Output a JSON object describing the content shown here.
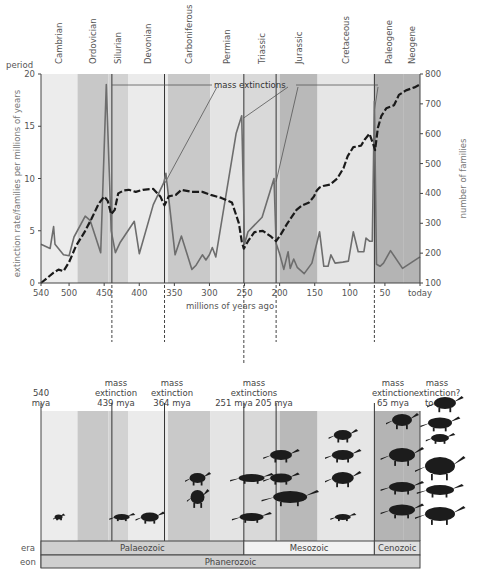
{
  "chart_data": {
    "type": "line",
    "title": "",
    "xlabel": "millions of years ago",
    "ylabel_left": "extinction rate/families per millions of years",
    "ylabel_right": "number of families",
    "xlim": [
      540,
      0
    ],
    "ylim_left": [
      0,
      20
    ],
    "ylim_right": [
      100,
      800
    ],
    "x_ticks": [
      {
        "value": 540,
        "label": "540"
      },
      {
        "value": 500,
        "label": "500"
      },
      {
        "value": 450,
        "label": "450"
      },
      {
        "value": 400,
        "label": "400"
      },
      {
        "value": 350,
        "label": "350"
      },
      {
        "value": 300,
        "label": "300"
      },
      {
        "value": 250,
        "label": "250"
      },
      {
        "value": 200,
        "label": "200"
      },
      {
        "value": 150,
        "label": "150"
      },
      {
        "value": 100,
        "label": "100"
      },
      {
        "value": 50,
        "label": "50"
      },
      {
        "value": 0,
        "label": "today"
      }
    ],
    "y_ticks_left": [
      "0",
      "5",
      "10",
      "15",
      "20"
    ],
    "y_ticks_right": [
      "100",
      "200",
      "300",
      "400",
      "500",
      "600",
      "700",
      "800"
    ],
    "periods_axis_label": "period",
    "periods": [
      {
        "name": "Cambrian",
        "start": 540,
        "end": 488,
        "shade": "#ececec"
      },
      {
        "name": "Ordovician",
        "start": 488,
        "end": 444,
        "shade": "#c8c8c8"
      },
      {
        "name": "Silurian",
        "start": 444,
        "end": 416,
        "shade": "#d2d2d2"
      },
      {
        "name": "Devonian",
        "start": 416,
        "end": 359,
        "shade": "#ebebeb"
      },
      {
        "name": "Carboniferous",
        "start": 359,
        "end": 299,
        "shade": "#c9c9c9"
      },
      {
        "name": "Permian",
        "start": 299,
        "end": 251,
        "shade": "#e4e4e4"
      },
      {
        "name": "Triassic",
        "start": 251,
        "end": 200,
        "shade": "#d9d9d9"
      },
      {
        "name": "Jurassic",
        "start": 200,
        "end": 146,
        "shade": "#b9b9b9"
      },
      {
        "name": "Cretaceous",
        "start": 146,
        "end": 65,
        "shade": "#e6e6e6"
      },
      {
        "name": "Paleogene",
        "start": 65,
        "end": 23,
        "shade": "#b4b4b4"
      },
      {
        "name": "Neogene",
        "start": 23,
        "end": 0,
        "shade": "#b4b4b4"
      }
    ],
    "series": [
      {
        "name": "extinction rate (families per million years)",
        "axis": "left",
        "style": "solid grey",
        "color": "#6d6d6d",
        "x": [
          540,
          527,
          522,
          520,
          508,
          500,
          493,
          477,
          470,
          455,
          447,
          440,
          434,
          427,
          407,
          400,
          380,
          365,
          362,
          349,
          340,
          325,
          319,
          310,
          305,
          300,
          296,
          291,
          262,
          254,
          250,
          245,
          225,
          208,
          205,
          200,
          194,
          188,
          185,
          180,
          175,
          165,
          154,
          143,
          137,
          131,
          127,
          121,
          110,
          102,
          95,
          88,
          80,
          77,
          72,
          68,
          65,
          62,
          57,
          52,
          42,
          25,
          0
        ],
        "y": [
          3.7,
          3.3,
          5.4,
          3.7,
          2.7,
          2.6,
          4.4,
          6.4,
          6.0,
          2.9,
          19.0,
          5.0,
          2.9,
          3.9,
          5.9,
          2.8,
          7.5,
          9.6,
          10.5,
          2.7,
          4.5,
          1.3,
          1.7,
          2.7,
          2.2,
          2.7,
          3.4,
          2.5,
          14.3,
          16.0,
          3.7,
          4.9,
          6.3,
          10.0,
          3.8,
          2.8,
          1.3,
          3.0,
          1.4,
          2.3,
          1.5,
          0.9,
          1.9,
          4.9,
          1.6,
          1.6,
          2.7,
          1.9,
          2.0,
          2.1,
          4.9,
          3.0,
          3.0,
          4.3,
          4.0,
          4.0,
          17.4,
          1.8,
          1.6,
          1.9,
          3.1,
          1.4,
          2.5
        ]
      },
      {
        "name": "number of families",
        "axis": "right",
        "style": "dashed black",
        "color": "#1a1a1a",
        "x": [
          540,
          532,
          522,
          515,
          508,
          500,
          490,
          478,
          468,
          458,
          450,
          445,
          440,
          435,
          430,
          422,
          415,
          405,
          395,
          380,
          370,
          364,
          358,
          348,
          340,
          325,
          310,
          298,
          283,
          268,
          258,
          254,
          251,
          245,
          236,
          224,
          212,
          205,
          199,
          189,
          176,
          168,
          158,
          151,
          147,
          143,
          138,
          128,
          118,
          109,
          103,
          95,
          84,
          79,
          72,
          66,
          64,
          60,
          55,
          48,
          37,
          30,
          20,
          8,
          0
        ],
        "y": [
          100,
          115,
          135,
          145,
          140,
          170,
          225,
          270,
          315,
          365,
          390,
          375,
          330,
          345,
          400,
          410,
          412,
          405,
          412,
          415,
          390,
          360,
          390,
          395,
          412,
          405,
          405,
          395,
          385,
          370,
          300,
          240,
          215,
          240,
          270,
          275,
          255,
          240,
          260,
          300,
          345,
          360,
          370,
          390,
          410,
          420,
          425,
          430,
          450,
          485,
          525,
          555,
          560,
          580,
          600,
          560,
          545,
          620,
          660,
          685,
          695,
          730,
          745,
          755,
          765
        ]
      }
    ],
    "annotations": [
      {
        "text": "mass extinctions",
        "points_to": [
          439,
          364,
          251,
          205,
          65
        ]
      }
    ],
    "mass_extinction_lines": [
      439,
      364,
      251,
      205,
      65
    ],
    "grid": false,
    "legend": null
  },
  "timeline": {
    "top_labels": [
      {
        "lines": [
          "540",
          "mya"
        ],
        "x": 540
      },
      {
        "lines": [
          "mass",
          "extinction",
          "439 mya"
        ],
        "x": 439
      },
      {
        "lines": [
          "mass",
          "extinction",
          "364 mya"
        ],
        "x": 364
      },
      {
        "lines": [
          "mass",
          "extinctions",
          "251 mya  205 mya"
        ],
        "x": 228
      },
      {
        "lines": [
          "mass",
          "extinction",
          "65 mya"
        ],
        "x": 65
      },
      {
        "lines": [
          "mass",
          "extinction?",
          "today"
        ],
        "x": 0
      }
    ],
    "era_label": "era",
    "eon_label": "eon",
    "eras": [
      {
        "name": "Palaeozoic",
        "start": 540,
        "end": 251,
        "shade": "#cfcfcf"
      },
      {
        "name": "Mesozoic",
        "start": 251,
        "end": 65,
        "shade": "#f2f2f2"
      },
      {
        "name": "Cenozoic",
        "start": 65,
        "end": 0,
        "shade": "#e0e0e0"
      }
    ],
    "eon": {
      "name": "Phanerozoic",
      "shade": "#cfcfcf"
    },
    "animals": [
      {
        "name": "trilobite",
        "x": 515,
        "row": 4
      },
      {
        "name": "fish",
        "x": 425,
        "row": 4
      },
      {
        "name": "early-amphibian",
        "x": 385,
        "row": 4
      },
      {
        "name": "dimetrodon",
        "x": 317,
        "row": 2
      },
      {
        "name": "lizard",
        "x": 317,
        "row": 3
      },
      {
        "name": "early-dinosaur",
        "x": 240,
        "row": 2
      },
      {
        "name": "crocodilian",
        "x": 240,
        "row": 4
      },
      {
        "name": "theropod",
        "x": 198,
        "row": 1
      },
      {
        "name": "pterosaur",
        "x": 198,
        "row": 2
      },
      {
        "name": "sauropod",
        "x": 185,
        "row": 3
      },
      {
        "name": "small-theropod",
        "x": 110,
        "row": 0
      },
      {
        "name": "triceratops",
        "x": 110,
        "row": 1
      },
      {
        "name": "tyrannosaur",
        "x": 110,
        "row": 2
      },
      {
        "name": "small-reptile",
        "x": 110,
        "row": 4
      }
    ]
  }
}
